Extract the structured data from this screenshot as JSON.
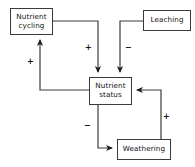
{
  "diagram": {
    "stroke_color": "#3a3a3a",
    "text_color": "#111111",
    "background_color": "#ffffff",
    "nodes": [
      {
        "id": "nutrient-cycling",
        "label": "Nutrient cycling",
        "line1": "Nutrient",
        "line2": "cycling"
      },
      {
        "id": "leaching",
        "label": "Leaching",
        "line1": "Leaching",
        "line2": ""
      },
      {
        "id": "nutrient-status",
        "label": "Nutrient status",
        "line1": "Nutrient",
        "line2": "status"
      },
      {
        "id": "weathering",
        "label": "Weathering",
        "line1": "Weathering",
        "line2": ""
      }
    ],
    "edges": [
      {
        "id": "cycling-to-status",
        "from": "nutrient-cycling",
        "to": "nutrient-status",
        "sign": "+"
      },
      {
        "id": "leaching-to-status",
        "from": "leaching",
        "to": "nutrient-status",
        "sign": "−"
      },
      {
        "id": "status-to-cycling",
        "from": "nutrient-status",
        "to": "nutrient-cycling",
        "sign": "+"
      },
      {
        "id": "status-to-weathering",
        "from": "nutrient-status",
        "to": "weathering",
        "sign": "−"
      },
      {
        "id": "weathering-to-status",
        "from": "weathering",
        "to": "nutrient-status",
        "sign": "+"
      }
    ]
  }
}
